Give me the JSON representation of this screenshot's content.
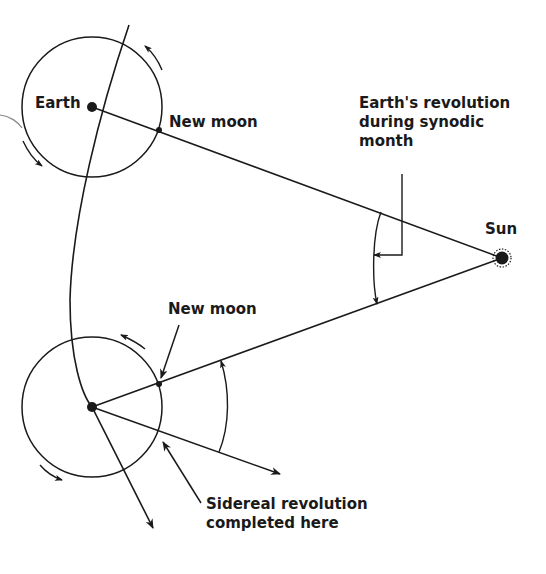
{
  "labels": {
    "earth": "Earth",
    "new_moon_top": "New moon",
    "new_moon_bottom": "New moon",
    "sun": "Sun",
    "earth_revolution": "Earth's revolution\nduring synodic\nmonth",
    "sidereal": "Sidereal revolution\ncompleted here"
  },
  "colors": {
    "ink": "#1a1a1a",
    "background": "#ffffff"
  }
}
